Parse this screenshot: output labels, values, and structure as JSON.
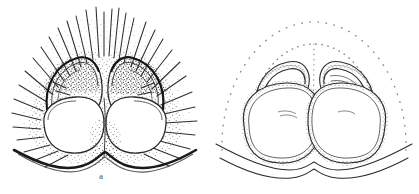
{
  "figure": {
    "kind": "scientific-line-drawing",
    "background_color": "#ffffff",
    "ink_color": "#2b2b2b",
    "stipple_color": "#4a4a4a",
    "width": 419,
    "height": 194,
    "panels": [
      {
        "id": "a",
        "label": "a",
        "label_position": {
          "x": 99,
          "y": 172
        },
        "description": "External view of bilobed structure with dense radiating setae and heavy stippling",
        "features": {
          "setae_count": 34,
          "lobes": 2,
          "stippling": "dense",
          "basal_margin": "heavy dark undulating line"
        }
      },
      {
        "id": "b",
        "label": "b",
        "label_position": {
          "x": 314,
          "y": 171
        },
        "description": "Cleared internal view showing paired spermathecae and coiled ducts with dotted outline",
        "features": {
          "dotted_arcs": 2,
          "spermathecae": 2,
          "stippling": "light granular along ducts",
          "basal_margin": "thin wavy double line"
        }
      }
    ]
  }
}
